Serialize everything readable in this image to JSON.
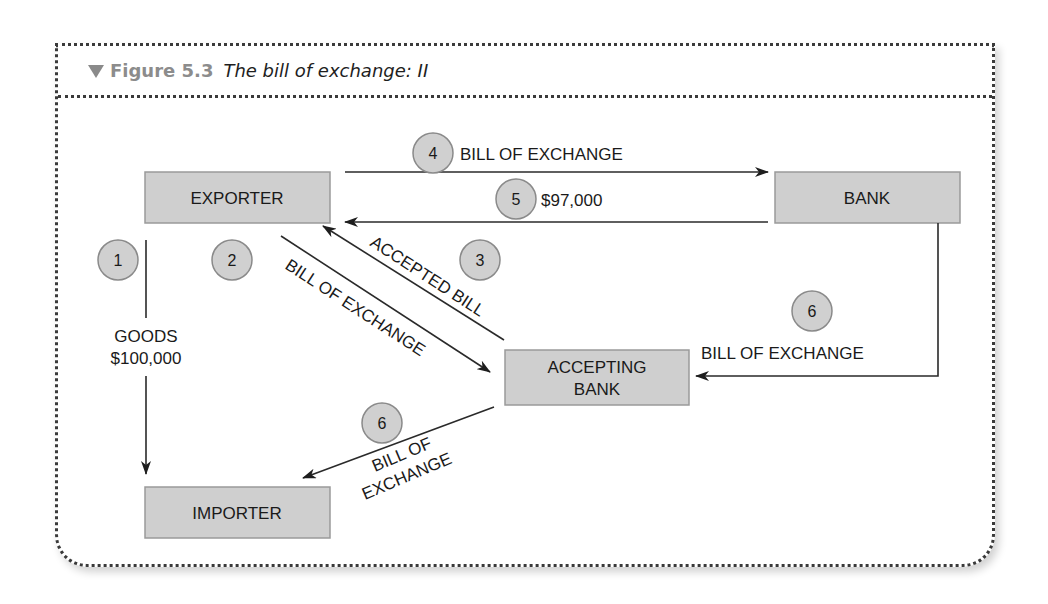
{
  "figure": {
    "number": "Figure 5.3",
    "title": "The bill of exchange: II",
    "colors": {
      "box_fill": "#cfcfcf",
      "circle_fill": "#d0d0d0",
      "header_number": "#8c8c8c",
      "line": "#2a2a2a"
    }
  },
  "nodes": {
    "exporter": "EXPORTER",
    "bank": "BANK",
    "accepting_bank_line1": "ACCEPTING",
    "accepting_bank_line2": "BANK",
    "importer": "IMPORTER"
  },
  "steps": {
    "s1": {
      "num": "1",
      "label_line1": "GOODS",
      "label_line2": "$100,000"
    },
    "s2": {
      "num": "2",
      "label": "BILL OF EXCHANGE"
    },
    "s3": {
      "num": "3",
      "label": "ACCEPTED BILL"
    },
    "s4": {
      "num": "4",
      "label": "BILL OF EXCHANGE"
    },
    "s5": {
      "num": "5",
      "label": "$97,000"
    },
    "s6a": {
      "num": "6",
      "label": "BILL OF EXCHANGE"
    },
    "s6b": {
      "num": "6",
      "label_line1": "BILL OF",
      "label_line2": "EXCHANGE"
    }
  }
}
